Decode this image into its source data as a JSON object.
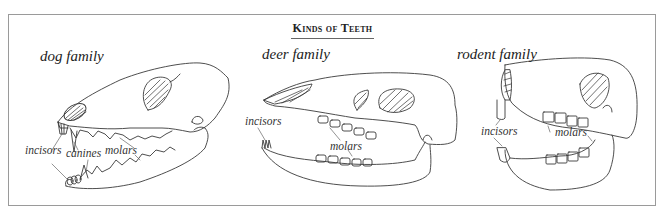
{
  "title": "Kinds of Teeth",
  "panels": [
    {
      "family": "dog family",
      "labels": {
        "incisors": "incisors",
        "canines": "canines",
        "molars": "molars"
      }
    },
    {
      "family": "deer family",
      "labels": {
        "incisors": "incisors",
        "molars": "molars"
      }
    },
    {
      "family": "rodent family",
      "labels": {
        "incisors": "incisors",
        "molars": "molars"
      }
    }
  ],
  "colors": {
    "line": "#3a3a3a",
    "border": "#9a9a9a",
    "text": "#222222"
  }
}
